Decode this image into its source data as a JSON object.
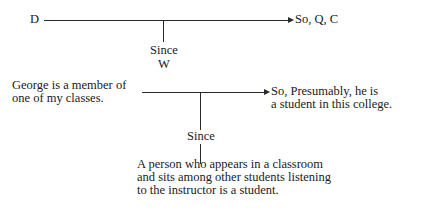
{
  "schema": {
    "data_label": "D",
    "conclusion_label": "So, Q, C",
    "warrant_connector": "Since",
    "warrant_label": "W"
  },
  "example": {
    "data_lines": [
      "George is a member of",
      "one of my classes."
    ],
    "conclusion_lines": [
      "So, Presumably, he is",
      "a student in this college."
    ],
    "warrant_connector": "Since",
    "warrant_lines": [
      "A person who appears in a classroom",
      "and sits among other students listening",
      "to the instructor is a student."
    ]
  }
}
